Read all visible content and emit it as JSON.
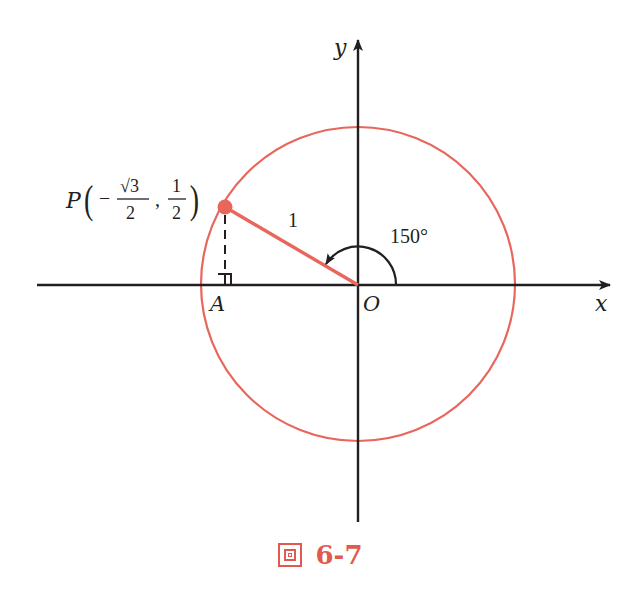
{
  "figure": {
    "axes": {
      "x_label": "x",
      "y_label": "y",
      "origin_label": "O"
    },
    "unit_circle": {
      "radius": 1,
      "color": "#e8665c"
    },
    "point_P": {
      "label": "P",
      "x_display": {
        "sign": "−",
        "numerator": "√3",
        "denominator": "2"
      },
      "y_display": {
        "numerator": "1",
        "denominator": "2"
      },
      "separator": ",",
      "angle_deg": 150
    },
    "foot_label": "A",
    "radius_label": "1",
    "angle_label": "150°",
    "accent_color": "#e8665c",
    "ink_color": "#231f20"
  },
  "caption": {
    "prefix": "圖",
    "number": "6-7",
    "color": "#e05a4e"
  }
}
